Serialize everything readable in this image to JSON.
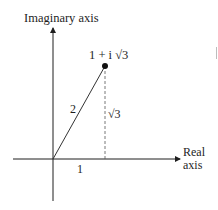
{
  "diagram": {
    "axes": {
      "vertical_label": "Imaginary axis",
      "horizontal_label_line1": "Real",
      "horizontal_label_line2": "axis"
    },
    "point": {
      "label": "1 + i √3",
      "real": 1,
      "imaginary": "√3"
    },
    "segments": {
      "modulus_label": "2",
      "height_label": "√3",
      "base_label": "1"
    },
    "colors": {
      "ink": "#1e1e1e",
      "background": "#ffffff",
      "dashed": "#555555"
    }
  }
}
